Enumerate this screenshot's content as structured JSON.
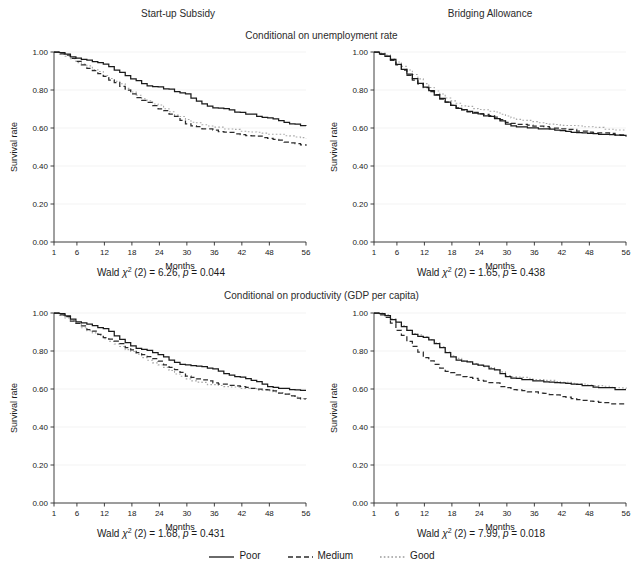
{
  "figure": {
    "column_titles": [
      "Start-up Subsidy",
      "Bridging Allowance"
    ],
    "row_subtitles": [
      "Conditional on unemployment rate",
      "Conditional on productivity (GDP per capita)"
    ]
  },
  "legend": {
    "items": [
      {
        "label": "Poor",
        "style": "solid",
        "color": "#1a1a1a"
      },
      {
        "label": "Medium",
        "style": "dashed",
        "color": "#2b2b2b"
      },
      {
        "label": "Good",
        "style": "dotted",
        "color": "#9a9a9a"
      }
    ]
  },
  "panels": [
    {
      "id": "top-left",
      "wald_prefix": "Wald ",
      "wald_chi": "χ",
      "wald_mid": " (2) = 6.26, ",
      "wald_p": "p",
      "wald_value": " = 0.044"
    },
    {
      "id": "top-right",
      "wald_prefix": "Wald ",
      "wald_chi": "χ",
      "wald_mid": " (2) = 1.65, ",
      "wald_p": "p",
      "wald_value": " = 0.438"
    },
    {
      "id": "bottom-left",
      "wald_prefix": "Wald ",
      "wald_chi": "χ",
      "wald_mid": " (2) = 1.68, ",
      "wald_p": "p",
      "wald_value": " = 0.431"
    },
    {
      "id": "bottom-right",
      "wald_prefix": "Wald ",
      "wald_chi": "χ",
      "wald_mid": " (2) = 7.99, ",
      "wald_p": "p",
      "wald_value": " = 0.018"
    }
  ],
  "chart_data": {
    "type": "line",
    "layout": "2x2 grid of Kaplan-Meier survival curves",
    "xlabel": "Months",
    "ylabel": "Survival rate",
    "xlim": [
      1,
      56
    ],
    "ylim": [
      0,
      1
    ],
    "xticks": [
      1,
      6,
      12,
      18,
      24,
      30,
      36,
      42,
      48,
      56
    ],
    "xticklabels": [
      "1",
      "6",
      "12",
      "18",
      "24",
      "30",
      "36",
      "42",
      "48",
      "56"
    ],
    "yticks": [
      0.0,
      0.2,
      0.4,
      0.6,
      0.8,
      1.0
    ],
    "yticklabels": [
      "0.00",
      "0.20",
      "0.40",
      "0.60",
      "0.80",
      "1.00"
    ],
    "grid": "horizontal-faint",
    "legend_position": "bottom-center",
    "series_names": [
      "Poor",
      "Medium",
      "Good"
    ],
    "panels": [
      {
        "title": "Start-up Subsidy",
        "subtitle": "Conditional on unemployment rate",
        "position": "top-left",
        "wald_chi2": 6.26,
        "wald_df": 2,
        "p_value": 0.044,
        "x": [
          1,
          3,
          6,
          9,
          12,
          15,
          18,
          21,
          24,
          27,
          30,
          33,
          36,
          39,
          42,
          45,
          48,
          51,
          54,
          56
        ],
        "series": [
          {
            "name": "Poor",
            "values": [
              1.0,
              0.99,
              0.965,
              0.955,
              0.935,
              0.895,
              0.855,
              0.825,
              0.815,
              0.795,
              0.775,
              0.725,
              0.705,
              0.695,
              0.68,
              0.665,
              0.65,
              0.635,
              0.615,
              0.612
            ]
          },
          {
            "name": "Medium",
            "values": [
              1.0,
              0.985,
              0.945,
              0.905,
              0.865,
              0.825,
              0.775,
              0.735,
              0.7,
              0.665,
              0.62,
              0.6,
              0.585,
              0.575,
              0.565,
              0.555,
              0.545,
              0.53,
              0.515,
              0.508
            ]
          },
          {
            "name": "Good",
            "values": [
              1.0,
              0.985,
              0.945,
              0.915,
              0.875,
              0.835,
              0.785,
              0.745,
              0.715,
              0.675,
              0.64,
              0.62,
              0.605,
              0.595,
              0.585,
              0.578,
              0.57,
              0.562,
              0.552,
              0.548
            ]
          }
        ]
      },
      {
        "title": "Bridging Allowance",
        "subtitle": "Conditional on unemployment rate",
        "position": "top-right",
        "wald_chi2": 1.65,
        "wald_df": 2,
        "p_value": 0.438,
        "x": [
          1,
          3,
          6,
          9,
          12,
          15,
          18,
          21,
          24,
          27,
          30,
          33,
          36,
          39,
          42,
          45,
          48,
          51,
          54,
          56
        ],
        "series": [
          {
            "name": "Poor",
            "values": [
              1.0,
              0.985,
              0.935,
              0.865,
              0.81,
              0.76,
              0.715,
              0.69,
              0.67,
              0.655,
              0.615,
              0.608,
              0.6,
              0.592,
              0.585,
              0.578,
              0.572,
              0.566,
              0.56,
              0.558
            ]
          },
          {
            "name": "Medium",
            "values": [
              1.0,
              0.985,
              0.93,
              0.86,
              0.805,
              0.76,
              0.715,
              0.69,
              0.672,
              0.658,
              0.63,
              0.62,
              0.612,
              0.604,
              0.596,
              0.588,
              0.58,
              0.572,
              0.564,
              0.56
            ]
          },
          {
            "name": "Good",
            "values": [
              1.0,
              0.988,
              0.945,
              0.885,
              0.83,
              0.782,
              0.738,
              0.712,
              0.698,
              0.69,
              0.66,
              0.645,
              0.632,
              0.624,
              0.616,
              0.61,
              0.604,
              0.598,
              0.592,
              0.59
            ]
          }
        ]
      },
      {
        "title": "Start-up Subsidy",
        "subtitle": "Conditional on productivity (GDP per capita)",
        "position": "bottom-left",
        "wald_chi2": 1.68,
        "wald_df": 2,
        "p_value": 0.431,
        "x": [
          1,
          3,
          6,
          9,
          12,
          15,
          18,
          21,
          24,
          27,
          30,
          33,
          36,
          39,
          42,
          45,
          48,
          51,
          54,
          56
        ],
        "series": [
          {
            "name": "Poor",
            "values": [
              1.0,
              0.988,
              0.95,
              0.938,
              0.915,
              0.868,
              0.822,
              0.805,
              0.78,
              0.742,
              0.725,
              0.72,
              0.7,
              0.678,
              0.66,
              0.64,
              0.612,
              0.602,
              0.595,
              0.592
            ]
          },
          {
            "name": "Medium",
            "values": [
              1.0,
              0.982,
              0.94,
              0.905,
              0.872,
              0.84,
              0.8,
              0.775,
              0.74,
              0.702,
              0.668,
              0.648,
              0.632,
              0.622,
              0.612,
              0.602,
              0.592,
              0.572,
              0.552,
              0.545
            ]
          },
          {
            "name": "Good",
            "values": [
              1.0,
              0.982,
              0.938,
              0.9,
              0.862,
              0.828,
              0.792,
              0.758,
              0.722,
              0.685,
              0.65,
              0.632,
              0.62,
              0.612,
              0.605,
              0.598,
              0.59,
              0.572,
              0.552,
              0.548
            ]
          }
        ]
      },
      {
        "title": "Bridging Allowance",
        "subtitle": "Conditional on productivity (GDP per capita)",
        "position": "bottom-right",
        "wald_chi2": 7.99,
        "wald_df": 2,
        "p_value": 0.018,
        "x": [
          1,
          3,
          6,
          9,
          12,
          15,
          18,
          21,
          24,
          27,
          30,
          33,
          36,
          39,
          42,
          45,
          48,
          51,
          54,
          56
        ],
        "series": [
          {
            "name": "Poor",
            "values": [
              1.0,
              0.995,
              0.945,
              0.895,
              0.868,
              0.828,
              0.76,
              0.742,
              0.722,
              0.705,
              0.66,
              0.652,
              0.645,
              0.638,
              0.63,
              0.622,
              0.615,
              0.608,
              0.598,
              0.595
            ]
          },
          {
            "name": "Medium",
            "values": [
              1.0,
              0.988,
              0.905,
              0.832,
              0.762,
              0.712,
              0.68,
              0.662,
              0.645,
              0.632,
              0.6,
              0.592,
              0.582,
              0.572,
              0.56,
              0.545,
              0.535,
              0.528,
              0.52,
              0.518
            ]
          },
          {
            "name": "Good",
            "values": [
              1.0,
              0.995,
              0.948,
              0.898,
              0.872,
              0.832,
              0.765,
              0.746,
              0.726,
              0.708,
              0.668,
              0.66,
              0.652,
              0.645,
              0.638,
              0.63,
              0.622,
              0.614,
              0.604,
              0.6
            ]
          }
        ]
      }
    ]
  }
}
